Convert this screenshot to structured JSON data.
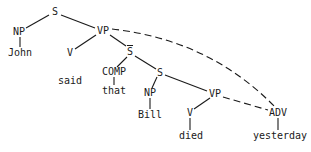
{
  "diagram": {
    "type": "syntax-tree",
    "nodes": [
      {
        "id": "S1",
        "label": "S",
        "x": 55,
        "y": 12
      },
      {
        "id": "NP1",
        "label": "NP",
        "x": 19,
        "y": 32
      },
      {
        "id": "John",
        "label": "John",
        "x": 20,
        "y": 53
      },
      {
        "id": "VP1",
        "label": "VP",
        "x": 103,
        "y": 31
      },
      {
        "id": "V1",
        "label": "V",
        "x": 70,
        "y": 53
      },
      {
        "id": "said",
        "label": "said",
        "x": 70,
        "y": 81
      },
      {
        "id": "Sbar",
        "label": "S",
        "x": 130,
        "y": 52,
        "overline": true
      },
      {
        "id": "COMP",
        "label": "COMP",
        "x": 114,
        "y": 72
      },
      {
        "id": "that",
        "label": "that",
        "x": 114,
        "y": 91
      },
      {
        "id": "S2",
        "label": "S",
        "x": 160,
        "y": 73
      },
      {
        "id": "NP2",
        "label": "NP",
        "x": 150,
        "y": 93
      },
      {
        "id": "Bill",
        "label": "Bill",
        "x": 150,
        "y": 115
      },
      {
        "id": "VP2",
        "label": "VP",
        "x": 215,
        "y": 94
      },
      {
        "id": "V2",
        "label": "V",
        "x": 190,
        "y": 113
      },
      {
        "id": "died",
        "label": "died",
        "x": 191,
        "y": 136
      },
      {
        "id": "ADV",
        "label": "ADV",
        "x": 278,
        "y": 113
      },
      {
        "id": "yesterday",
        "label": "yesterday",
        "x": 280,
        "y": 136
      }
    ],
    "edges": [
      {
        "from": "S1",
        "to": "NP1",
        "style": "solid",
        "x1": 49,
        "y1": 15,
        "x2": 26,
        "y2": 28
      },
      {
        "from": "S1",
        "to": "VP1",
        "style": "solid",
        "x1": 61,
        "y1": 15,
        "x2": 95,
        "y2": 28
      },
      {
        "from": "NP1",
        "to": "John",
        "style": "solid",
        "x1": 20,
        "y1": 37,
        "x2": 20,
        "y2": 47
      },
      {
        "from": "VP1",
        "to": "V1",
        "style": "solid",
        "x1": 96,
        "y1": 35,
        "x2": 75,
        "y2": 49
      },
      {
        "from": "VP1",
        "to": "Sbar",
        "style": "solid",
        "x1": 110,
        "y1": 35,
        "x2": 126,
        "y2": 46
      },
      {
        "from": "Sbar",
        "to": "COMP",
        "style": "solid",
        "x1": 127,
        "y1": 57,
        "x2": 117,
        "y2": 67
      },
      {
        "from": "Sbar",
        "to": "S2",
        "style": "solid",
        "x1": 135,
        "y1": 56,
        "x2": 156,
        "y2": 69
      },
      {
        "from": "COMP",
        "to": "that",
        "style": "solid",
        "x1": 114,
        "y1": 77,
        "x2": 114,
        "y2": 85
      },
      {
        "from": "S2",
        "to": "NP2",
        "style": "solid",
        "x1": 157,
        "y1": 77,
        "x2": 152,
        "y2": 88
      },
      {
        "from": "S2",
        "to": "VP2",
        "style": "solid",
        "x1": 165,
        "y1": 75,
        "x2": 207,
        "y2": 91
      },
      {
        "from": "NP2",
        "to": "Bill",
        "style": "solid",
        "x1": 150,
        "y1": 98,
        "x2": 150,
        "y2": 109
      },
      {
        "from": "VP2",
        "to": "V2",
        "style": "solid",
        "x1": 210,
        "y1": 98,
        "x2": 194,
        "y2": 109
      },
      {
        "from": "V2",
        "to": "died",
        "style": "solid",
        "x1": 190,
        "y1": 118,
        "x2": 190,
        "y2": 130
      },
      {
        "from": "ADV",
        "to": "yesterday",
        "style": "solid",
        "x1": 278,
        "y1": 118,
        "x2": 278,
        "y2": 130
      },
      {
        "from": "VP2",
        "to": "ADV",
        "style": "dashed",
        "path": "M223,97 L268,110"
      },
      {
        "from": "VP1",
        "to": "ADV",
        "style": "dashed",
        "path": "M112,29 Q210,40 275,107"
      }
    ],
    "colors": {
      "ink": "#1a1a1a",
      "background": "#ffffff"
    }
  }
}
